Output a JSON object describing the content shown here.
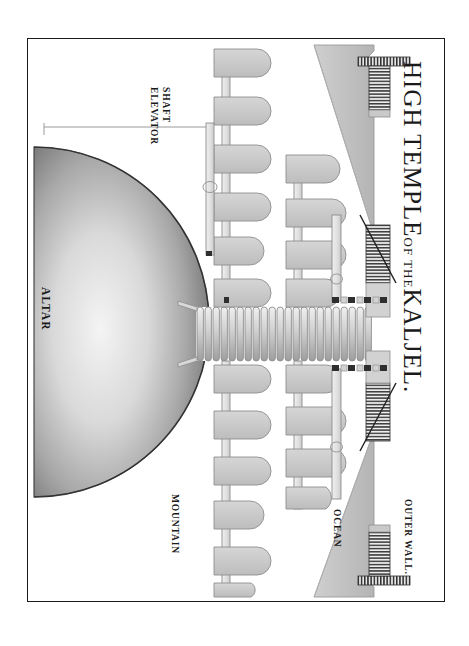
{
  "plate": {
    "title_main": "HIGH TEMPLE",
    "title_connector": "OF THE",
    "title_subject": "KALJEL.",
    "border_color": "#1b1b1b",
    "paper_color": "#ffffff"
  },
  "labels": {
    "altar": "ALTAR",
    "elevator_line1": "ELEVATOR",
    "elevator_line2": "SHAFT",
    "mountain": "MOUNTAIN",
    "ocean": "OCEAN",
    "outer_wall": "OUTER WALL."
  },
  "palette": {
    "stone_fill": "#c9c9c9",
    "stone_stroke": "#8d8d8d",
    "wedge_fill": "#c2c2c2",
    "wedge_stroke": "#9a9a9a",
    "shaft_fill": "#e8e8e8",
    "shaft_stroke": "#909090",
    "hatch_dark": "#3a3a3a",
    "ink": "#1a1a1a",
    "dome_light": "#f2f2f2",
    "dome_dark": "#5e5e5e"
  },
  "structure": {
    "dome_label": "altar-dome",
    "tunnel_rib_count": 22,
    "upper_corridor_rooms": 6,
    "upper_inner_rooms": 4,
    "lower_corridor_rooms": 5,
    "lower_inner_rooms": 4,
    "gate_count": 4,
    "gate_names": [
      "gate-upper-outer",
      "gate-upper-inner",
      "gate-lower-inner",
      "gate-lower-outer"
    ]
  }
}
